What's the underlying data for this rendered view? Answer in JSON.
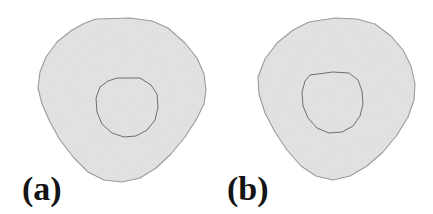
{
  "figure": {
    "background_color": "#ffffff",
    "width": 433,
    "height": 214,
    "panel_count": 2,
    "caption_style": "bold-serif-parenthesized"
  },
  "panels": [
    {
      "id": "panel-a",
      "label": "(a)",
      "label_position": "bottom-left",
      "outer_shape": {
        "name": "outer-blob",
        "type": "polygon",
        "fill_color": "#e3e3e3",
        "stroke_color": "#9a9a9a",
        "stroke_width": 1.1,
        "points": "96,19 130,18 152,21 168,28 185,43 197,58 204,74 206,90 204,104 196,120 185,137 171,154 156,168 140,178 122,182 104,180 88,172 74,158 60,140 50,122 42,104 38,88 40,72 46,57 57,42 72,30 85,23"
      },
      "inner_shape": {
        "name": "inner-contour",
        "type": "polygon",
        "fill_color": "#e3e3e3",
        "stroke_color": "#6f6f6f",
        "stroke_width": 1.0,
        "points": "117,78 140,78 151,85 157,94 158,107 155,120 147,130 136,136 124,137 112,133 102,124 97,112 96,98 100,87 108,81"
      }
    },
    {
      "id": "panel-b",
      "label": "(b)",
      "label_position": "bottom-left",
      "outer_shape": {
        "name": "outer-blob",
        "type": "polygon",
        "fill_color": "#e3e3e3",
        "stroke_color": "#9a9a9a",
        "stroke_width": 1.1,
        "points": "92,22 118,18 140,19 158,24 174,36 186,50 194,66 198,84 197,100 191,117 180,135 166,152 150,166 133,176 116,180 99,176 84,166 70,150 58,132 48,113 42,94 41,77 48,59 60,43 76,30"
      },
      "inner_shape": {
        "name": "inner-contour",
        "type": "polygon",
        "fill_color": "#e3e3e3",
        "stroke_color": "#6f6f6f",
        "stroke_width": 1.0,
        "points": "93,75 116,72 132,73 141,80 145,91 146,104 143,116 136,126 125,132 112,133 100,128 91,118 86,106 85,92 88,81"
      }
    }
  ]
}
